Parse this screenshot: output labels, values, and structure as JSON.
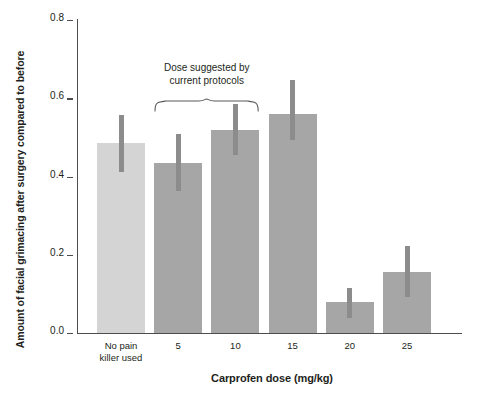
{
  "chart_data": {
    "type": "bar",
    "title": "",
    "xlabel": "Carprofen dose (mg/kg)",
    "ylabel": "Amount of facial grimacing after surgery compared to before",
    "categories": [
      "No pain\nkiller used",
      "5",
      "10",
      "15",
      "20",
      "25"
    ],
    "values": [
      0.485,
      0.435,
      0.52,
      0.56,
      0.08,
      0.155
    ],
    "errors_upper": [
      0.558,
      0.509,
      0.586,
      0.647,
      0.115,
      0.222
    ],
    "errors_lower": [
      0.412,
      0.363,
      0.455,
      0.494,
      0.038,
      0.093
    ],
    "bar_colors": [
      "#d4d4d4",
      "#a6a6a6",
      "#a6a6a6",
      "#a6a6a6",
      "#a6a6a6",
      "#a6a6a6"
    ],
    "error_color": "#8c8c8c",
    "yticks": [
      0.0,
      0.2,
      0.4,
      0.6,
      0.8
    ],
    "ytick_labels": [
      "0.0",
      "0.2",
      "0.4",
      "0.6",
      "0.8"
    ],
    "ylim": [
      0.0,
      0.8
    ],
    "grid": false,
    "legend": "none",
    "annotations": [
      {
        "text": "Dose suggested by\ncurrent protocols",
        "spans_categories": [
          "5",
          "10"
        ],
        "style": "curly-brace"
      }
    ]
  },
  "axis": {
    "y_tick_labels": [
      "0.8",
      "0.6",
      "0.4",
      "0.2",
      "0.0"
    ],
    "y_label": "Amount of facial grimacing after surgery compared to before",
    "x_label": "Carprofen dose (mg/kg)",
    "x_tick_labels": [
      "No pain\nkiller used",
      "5",
      "10",
      "15",
      "20",
      "25"
    ]
  },
  "annotation": {
    "line1": "Dose suggested by",
    "line2": "current protocols"
  },
  "colors": {
    "bar_light": "#d4d4d4",
    "bar_dark": "#a6a6a6",
    "error": "#8c8c8c",
    "axis": "#4d4d4d",
    "text": "#231f20",
    "background": "#ffffff"
  }
}
